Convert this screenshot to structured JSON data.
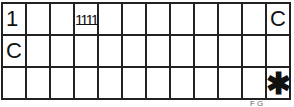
{
  "board": {
    "rows": 3,
    "cols": 12,
    "cells": [
      [
        "1",
        "",
        "",
        "1111",
        "",
        "",
        "",
        "",
        "",
        "",
        "",
        "C"
      ],
      [
        "C",
        "",
        "",
        "",
        "",
        "",
        "",
        "",
        "",
        "",
        "",
        ""
      ],
      [
        "",
        "",
        "",
        "",
        "",
        "",
        "",
        "",
        "",
        "",
        "",
        "✱"
      ]
    ]
  },
  "footer": {
    "text": "F  G"
  }
}
